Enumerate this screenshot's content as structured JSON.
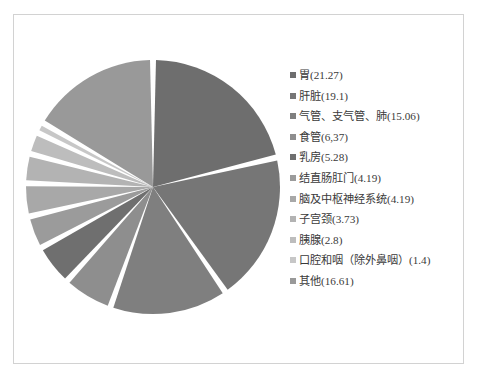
{
  "page": {
    "background_color": "#ffffff",
    "border_color": "#d2d2d2"
  },
  "chart_data": {
    "type": "pie",
    "title": "",
    "subtitle": "",
    "unit": "%",
    "legend_position": "right",
    "start_angle_deg": 0,
    "direction": "clockwise",
    "slice_gap": true,
    "categories": [
      "胃",
      "肝脏",
      "气管、支气管、肺",
      "食管",
      "乳房",
      "结直肠肛门",
      "脑及中枢神经系统",
      "子宫颈",
      "胰腺",
      "口腔和咽（除外鼻咽）",
      "其他"
    ],
    "values": [
      21.27,
      19.1,
      15.06,
      6.37,
      5.28,
      4.19,
      4.19,
      3.73,
      2.8,
      1.4,
      16.61
    ],
    "colors": [
      "#6e6e6e",
      "#767676",
      "#7f7f7f",
      "#8e8e8e",
      "#6f6f6f",
      "#9b9b9b",
      "#a8a8a8",
      "#b3b3b3",
      "#bdbdbd",
      "#c7c7c7",
      "#999999"
    ],
    "legend_entries": [
      {
        "label": "胃(21.27)",
        "value": 21.27,
        "color": "#6e6e6e"
      },
      {
        "label": "肝脏(19.1)",
        "value": 19.1,
        "color": "#767676"
      },
      {
        "label": "气管、支气管、肺(15.06)",
        "value": 15.06,
        "color": "#7f7f7f"
      },
      {
        "label": "食管(6,37)",
        "value": 6.37,
        "color": "#8e8e8e"
      },
      {
        "label": "乳房(5.28)",
        "value": 5.28,
        "color": "#6f6f6f"
      },
      {
        "label": "结直肠肛门(4.19)",
        "value": 4.19,
        "color": "#9b9b9b"
      },
      {
        "label": "脑及中枢神经系统(4.19)",
        "value": 4.19,
        "color": "#a8a8a8"
      },
      {
        "label": "子宫颈(3.73)",
        "value": 3.73,
        "color": "#b3b3b3"
      },
      {
        "label": "胰腺(2.8)",
        "value": 2.8,
        "color": "#bdbdbd"
      },
      {
        "label": "口腔和咽（除外鼻咽）(1.4)",
        "value": 1.4,
        "color": "#c7c7c7"
      },
      {
        "label": "其他(16.61)",
        "value": 16.61,
        "color": "#999999"
      }
    ]
  }
}
